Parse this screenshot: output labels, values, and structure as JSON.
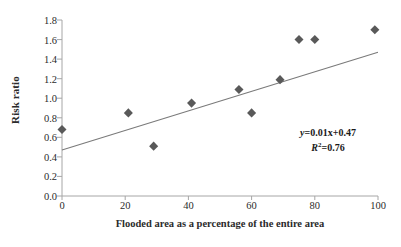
{
  "chart_data": {
    "type": "scatter",
    "title": "",
    "xlabel": "Flooded area as a percentage of the entire area",
    "ylabel": "Risk ratio",
    "xlim": [
      0,
      100
    ],
    "ylim": [
      0.0,
      1.8
    ],
    "xticks": [
      "0",
      "20",
      "40",
      "60",
      "80",
      "100"
    ],
    "xtick_values": [
      0,
      20,
      40,
      60,
      80,
      100
    ],
    "yticks": [
      "0.0",
      "0.2",
      "0.4",
      "0.6",
      "0.8",
      "1.0",
      "1.2",
      "1.4",
      "1.6",
      "1.8"
    ],
    "ytick_values": [
      0.0,
      0.2,
      0.4,
      0.6,
      0.8,
      1.0,
      1.2,
      1.4,
      1.6,
      1.8
    ],
    "grid": false,
    "legend": "none",
    "marker": "diamond",
    "marker_color": "#595959",
    "series": [
      {
        "name": "Risk ratio vs flooded area",
        "x": [
          0,
          21,
          29,
          41,
          56,
          60,
          69,
          75,
          80,
          99
        ],
        "y": [
          0.68,
          0.85,
          0.51,
          0.95,
          1.09,
          0.85,
          1.19,
          1.6,
          1.6,
          1.7
        ]
      }
    ],
    "trendline": {
      "type": "linear",
      "slope": 0.01,
      "intercept": 0.47,
      "x_start": 0,
      "x_end": 100,
      "y_start": 0.47,
      "y_end": 1.47,
      "color": "#7a7a7a"
    },
    "annotations": {
      "equation": "y=0.01x+0.47",
      "equation_var": "y",
      "equation_rest": "=0.01x+0.47",
      "r_squared_label": "R",
      "r_squared_exp": "2",
      "r_squared_value": "=0.76",
      "r_squared_full": "R²=0.76"
    },
    "axis_color": "#a6a6a6"
  }
}
